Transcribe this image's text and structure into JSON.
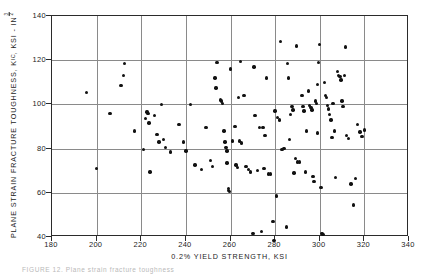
{
  "figure": {
    "background_color": "#ffffff",
    "axis_color": "#2b2b2b",
    "grid_color": "#8a8a8a",
    "point_color": "#111111"
  },
  "caption": "FIGURE 12.  Plane strain fracture toughness",
  "chart_data": {
    "type": "scatter",
    "title": "",
    "xlabel": "0.2% YIELD STRENGTH, KSI",
    "ylabel": "PLANE STRAIN FRACTURE TOUGHNESS, KIC, KSI - IN 3/2",
    "ylabel_parts": {
      "lead": "PLANE  STRAIN  FRACTURE  TOUGHNESS,  K",
      "subscript": "IC",
      "mid": ",  KSI - IN",
      "exp_numerator": "3",
      "exp_denominator": "2"
    },
    "xlim": [
      180,
      340
    ],
    "ylim": [
      40,
      140
    ],
    "xticks": [
      180,
      200,
      220,
      240,
      260,
      280,
      300,
      320,
      340
    ],
    "yticks": [
      40,
      60,
      80,
      100,
      120,
      140
    ],
    "grid": true,
    "legend": "none",
    "marker": "filled-circle",
    "n_points": 134,
    "points": [
      [
        195.5,
        105.5
      ],
      [
        200.0,
        71.0
      ],
      [
        206.0,
        96.0
      ],
      [
        211.0,
        108.5
      ],
      [
        212.0,
        113.0
      ],
      [
        212.5,
        118.5
      ],
      [
        217.0,
        88.0
      ],
      [
        221.0,
        79.5
      ],
      [
        222.0,
        93.5
      ],
      [
        222.5,
        96.5
      ],
      [
        223.0,
        96.0
      ],
      [
        223.5,
        91.5
      ],
      [
        224.0,
        69.5
      ],
      [
        226.0,
        95.0
      ],
      [
        227.0,
        86.5
      ],
      [
        228.0,
        83.0
      ],
      [
        229.0,
        100.0
      ],
      [
        230.0,
        84.0
      ],
      [
        231.0,
        80.5
      ],
      [
        233.0,
        78.5
      ],
      [
        237.0,
        91.0
      ],
      [
        239.0,
        83.0
      ],
      [
        240.0,
        79.0
      ],
      [
        242.0,
        100.0
      ],
      [
        244.0,
        72.5
      ],
      [
        247.0,
        70.5
      ],
      [
        249.0,
        89.5
      ],
      [
        251.0,
        74.5
      ],
      [
        252.0,
        72.0
      ],
      [
        253.0,
        112.0
      ],
      [
        254.0,
        119.0
      ],
      [
        255.5,
        102.0
      ],
      [
        256.0,
        101.5
      ],
      [
        256.5,
        100.5
      ],
      [
        257.0,
        88.0
      ],
      [
        257.5,
        83.0
      ],
      [
        258.0,
        80.5
      ],
      [
        258.5,
        79.0
      ],
      [
        258.5,
        73.5
      ],
      [
        259.0,
        62.0
      ],
      [
        259.0,
        61.0
      ],
      [
        259.5,
        60.5
      ],
      [
        260.0,
        116.0
      ],
      [
        261.0,
        83.5
      ],
      [
        262.0,
        90.0
      ],
      [
        262.5,
        72.5
      ],
      [
        263.0,
        71.5
      ],
      [
        264.0,
        83.5
      ],
      [
        265.0,
        82.5
      ],
      [
        266.0,
        104.0
      ],
      [
        267.0,
        72.0
      ],
      [
        268.0,
        70.5
      ],
      [
        269.0,
        69.5
      ],
      [
        270.0,
        41.5
      ],
      [
        271.0,
        95.0
      ],
      [
        272.0,
        70.0
      ],
      [
        273.0,
        89.5
      ],
      [
        274.0,
        42.5
      ],
      [
        274.5,
        89.5
      ],
      [
        275.0,
        71.0
      ],
      [
        276.0,
        112.0
      ],
      [
        277.0,
        68.5
      ],
      [
        278.0,
        68.5
      ],
      [
        279.0,
        47.0
      ],
      [
        279.5,
        38.5
      ],
      [
        280.0,
        97.0
      ],
      [
        281.0,
        94.0
      ],
      [
        282.0,
        93.0
      ],
      [
        283.0,
        79.5
      ],
      [
        284.0,
        80.0
      ],
      [
        285.0,
        44.5
      ],
      [
        286.0,
        112.0
      ],
      [
        287.0,
        95.5
      ],
      [
        287.5,
        99.0
      ],
      [
        288.0,
        97.5
      ],
      [
        289.0,
        75.5
      ],
      [
        290.0,
        74.0
      ],
      [
        291.0,
        74.0
      ],
      [
        292.0,
        104.0
      ],
      [
        292.5,
        99.0
      ],
      [
        293.0,
        97.0
      ],
      [
        294.0,
        88.0
      ],
      [
        295.0,
        106.0
      ],
      [
        295.5,
        99.5
      ],
      [
        296.0,
        98.5
      ],
      [
        296.5,
        97.5
      ],
      [
        297.0,
        67.5
      ],
      [
        297.5,
        65.0
      ],
      [
        298.0,
        101.5
      ],
      [
        298.5,
        100.5
      ],
      [
        299.0,
        109.0
      ],
      [
        299.5,
        119.0
      ],
      [
        300.0,
        127.0
      ],
      [
        300.5,
        62.5
      ],
      [
        301.0,
        41.5
      ],
      [
        301.5,
        41.0
      ],
      [
        302.0,
        110.0
      ],
      [
        302.5,
        104.0
      ],
      [
        303.0,
        103.0
      ],
      [
        303.5,
        99.5
      ],
      [
        304.0,
        98.0
      ],
      [
        304.5,
        95.5
      ],
      [
        305.0,
        93.0
      ],
      [
        306.0,
        100.5
      ],
      [
        306.5,
        88.0
      ],
      [
        307.0,
        67.0
      ],
      [
        308.0,
        115.0
      ],
      [
        308.5,
        113.0
      ],
      [
        309.0,
        112.5
      ],
      [
        309.5,
        111.0
      ],
      [
        310.0,
        101.5
      ],
      [
        310.5,
        99.0
      ],
      [
        311.0,
        113.0
      ],
      [
        311.5,
        126.0
      ],
      [
        312.0,
        86.0
      ],
      [
        313.0,
        84.5
      ],
      [
        314.0,
        64.0
      ],
      [
        315.0,
        54.5
      ],
      [
        316.0,
        66.5
      ],
      [
        317.0,
        91.0
      ],
      [
        318.0,
        87.5
      ],
      [
        319.0,
        85.5
      ],
      [
        320.0,
        88.5
      ],
      [
        264.5,
        119.5
      ],
      [
        270.5,
        117.0
      ],
      [
        282.5,
        128.5
      ],
      [
        289.5,
        126.5
      ],
      [
        253.5,
        107.5
      ],
      [
        285.5,
        118.5
      ],
      [
        263.5,
        103.0
      ],
      [
        275.5,
        86.0
      ],
      [
        286.5,
        84.0
      ],
      [
        299.0,
        87.0
      ],
      [
        305.5,
        85.0
      ],
      [
        293.5,
        69.5
      ],
      [
        288.5,
        69.0
      ],
      [
        280.5,
        58.5
      ]
    ]
  }
}
